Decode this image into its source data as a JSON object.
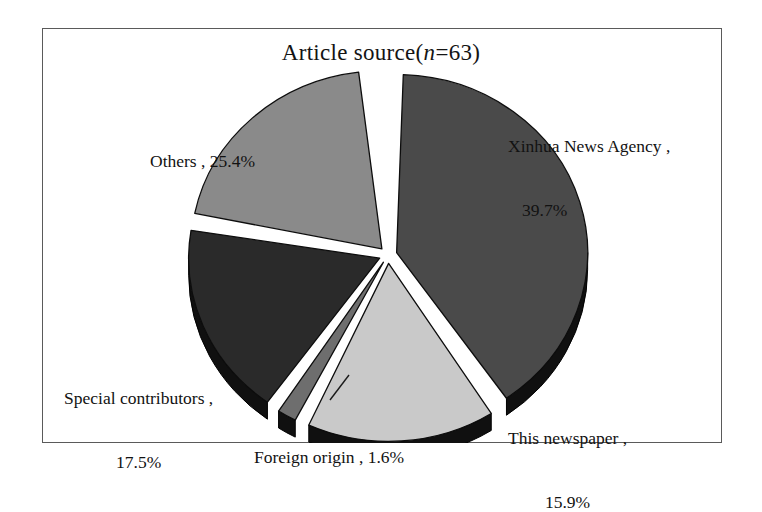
{
  "figure": {
    "title_prefix": "Article source(",
    "title_italic": "n",
    "title_suffix": "=63)",
    "title_full": "Article source(n=63)",
    "background_color": "#ffffff",
    "frame_color": "#5a5a5a"
  },
  "chart_data": {
    "type": "pie",
    "title": "Article source(n=63)",
    "subtitle": "",
    "xlabel": "",
    "ylabel": "",
    "total_n": 63,
    "exploded": true,
    "style": "3d-exploded-grayscale",
    "legend_position": "none-labels-around-slices",
    "grid": false,
    "categories": [
      "Xinhua News Agency",
      "This newspaper",
      "Foreign origin",
      "Special contributors",
      "Others"
    ],
    "values": [
      39.7,
      15.9,
      1.6,
      17.5,
      25.4
    ],
    "value_unit": "%",
    "colors": [
      "#4a4a4a",
      "#c9c9c9",
      "#6e6e6e",
      "#2a2a2a",
      "#8a8a8a"
    ],
    "depth_color": "#101010",
    "slices": [
      {
        "name": "Xinhua News Agency",
        "value": 39.7,
        "label_line_1": "Xinhua News Agency ,",
        "label_line_2": "39.7%",
        "color": "#4a4a4a",
        "start_angle_deg": 2,
        "end_angle_deg": 144.9
      },
      {
        "name": "This newspaper",
        "value": 15.9,
        "label_line_1": "This newspaper ,",
        "label_line_2": "15.9%",
        "color": "#c9c9c9",
        "start_angle_deg": 147.5,
        "end_angle_deg": 204.7
      },
      {
        "name": "Foreign origin",
        "value": 1.6,
        "label_line_1": "Foreign origin , 1.6%",
        "label_line_2": "",
        "color": "#6e6e6e",
        "start_angle_deg": 207.5,
        "end_angle_deg": 213.3
      },
      {
        "name": "Special contributors",
        "value": 17.5,
        "label_line_1": "Special contributors ,",
        "label_line_2": "17.5%",
        "color": "#2a2a2a",
        "start_angle_deg": 216,
        "end_angle_deg": 279
      },
      {
        "name": "Others",
        "value": 25.4,
        "label_line_1": "Others , 25.4%",
        "label_line_2": "",
        "color": "#8a8a8a",
        "start_angle_deg": 281.5,
        "end_angle_deg": 353
      }
    ]
  }
}
